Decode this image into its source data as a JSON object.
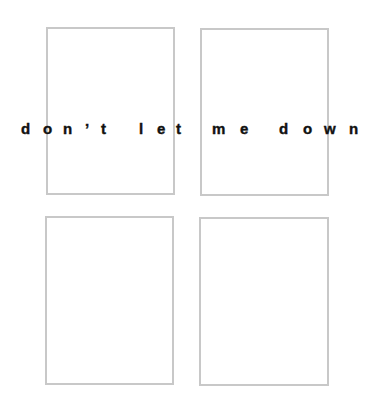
{
  "phrase": "don't let me down",
  "colors": {
    "background": "#ffffff",
    "frame_border": "#c8c8c8",
    "text": "#111111"
  },
  "frames": [
    {
      "id": "top-left",
      "x": 46,
      "y": 27,
      "w": 129,
      "h": 168
    },
    {
      "id": "top-right",
      "x": 200,
      "y": 28,
      "w": 129,
      "h": 168
    },
    {
      "id": "bottom-left",
      "x": 45,
      "y": 216,
      "w": 129,
      "h": 169
    },
    {
      "id": "bottom-right",
      "x": 199,
      "y": 217,
      "w": 130,
      "h": 169
    }
  ],
  "letters": [
    {
      "char": "d",
      "x": 21
    },
    {
      "char": "o",
      "x": 43
    },
    {
      "char": "n",
      "x": 63
    },
    {
      "char": "’",
      "x": 85
    },
    {
      "char": "t",
      "x": 101
    },
    {
      "char": "l",
      "x": 139
    },
    {
      "char": "e",
      "x": 157
    },
    {
      "char": "t",
      "x": 176
    },
    {
      "char": "m",
      "x": 212
    },
    {
      "char": "e",
      "x": 240
    },
    {
      "char": "d",
      "x": 279
    },
    {
      "char": "o",
      "x": 303
    },
    {
      "char": "w",
      "x": 324
    },
    {
      "char": "n",
      "x": 349
    }
  ]
}
